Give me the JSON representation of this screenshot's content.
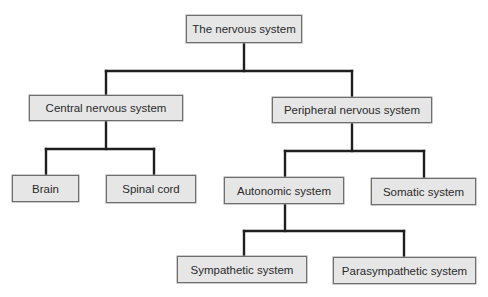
{
  "diagram": {
    "title": "The nervous system",
    "nodes": {
      "root": "The nervous system",
      "cns": "Central nervous system",
      "pns": "Peripheral nervous system",
      "brain": "Brain",
      "spinal_cord": "Spinal cord",
      "autonomic": "Autonomic system",
      "somatic": "Somatic system",
      "sympathetic": "Sympathetic system",
      "parasympathetic": "Parasympathetic system"
    },
    "edges": [
      [
        "root",
        "cns"
      ],
      [
        "root",
        "pns"
      ],
      [
        "cns",
        "brain"
      ],
      [
        "cns",
        "spinal_cord"
      ],
      [
        "pns",
        "autonomic"
      ],
      [
        "pns",
        "somatic"
      ],
      [
        "autonomic",
        "sympathetic"
      ],
      [
        "autonomic",
        "parasympathetic"
      ]
    ],
    "colors": {
      "box_fill": "#e6e6e6",
      "box_border": "#6e6e6e",
      "connector": "#1e1e1e",
      "text": "#2a2a2a"
    }
  }
}
